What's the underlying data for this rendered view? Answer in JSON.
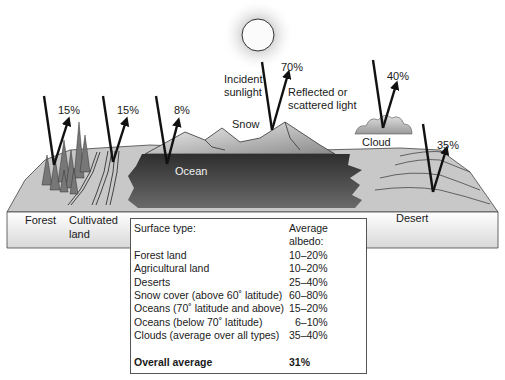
{
  "diagram": {
    "labels": {
      "incident": "Incident\nsunlight",
      "incident_line1": "Incident",
      "incident_line2": "sunlight",
      "reflected_line1": "Reflected or",
      "reflected_line2": "scattered light",
      "snow": "Snow",
      "ocean": "Ocean",
      "cloud": "Cloud",
      "forest": "Forest",
      "cultivated_line1": "Cultivated",
      "cultivated_line2": "land",
      "desert": "Desert"
    },
    "reflections": [
      {
        "surface": "Forest",
        "percent": "15%"
      },
      {
        "surface": "Cultivated land",
        "percent": "15%"
      },
      {
        "surface": "Ocean",
        "percent": "8%"
      },
      {
        "surface": "Snow",
        "percent": "70%"
      },
      {
        "surface": "Cloud",
        "percent": "40%"
      },
      {
        "surface": "Desert",
        "percent": "35%"
      }
    ]
  },
  "table": {
    "headers": {
      "surface": "Surface type:",
      "albedo": "Average albedo:"
    },
    "rows": [
      {
        "surface": "Forest land",
        "albedo": "10–20%"
      },
      {
        "surface": "Agricultural land",
        "albedo": "10–20%"
      },
      {
        "surface": "Deserts",
        "albedo": "25–40%"
      },
      {
        "surface": "Snow cover (above 60˚ latitude)",
        "albedo": "60–80%"
      },
      {
        "surface": "Oceans (70˚ latitude and above)",
        "albedo": "15–20%"
      },
      {
        "surface": "Oceans (below 70˚ latitude)",
        "albedo": "6–10%"
      },
      {
        "surface": "Clouds (average over all types)",
        "albedo": "35–40%"
      }
    ],
    "total": {
      "surface": "Overall average",
      "albedo": "31%"
    }
  }
}
